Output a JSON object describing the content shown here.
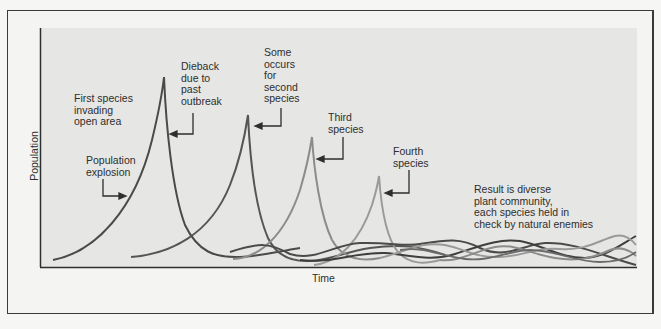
{
  "figure": {
    "ylabel": "Population",
    "xlabel": "Time",
    "annotations": [
      {
        "id": "first-species",
        "text": "First species\ninvading\nopen area"
      },
      {
        "id": "population-explosion",
        "text": "Population\nexplosion"
      },
      {
        "id": "dieback",
        "text": "Dieback\ndue to\npast\noutbreak"
      },
      {
        "id": "second-species",
        "text": "Some\noccurs\nfor\nsecond\nspecies"
      },
      {
        "id": "third-species",
        "text": "Third\nspecies"
      },
      {
        "id": "fourth-species",
        "text": "Fourth\nspecies"
      },
      {
        "id": "result",
        "text": "Result is diverse\nplant community,\neach species held in\ncheck by natural enemies"
      }
    ]
  },
  "series": [
    {
      "name": "First species",
      "color": "#4a4a4a",
      "peak_x": 164,
      "peak_y": 77
    },
    {
      "name": "Second species",
      "color": "#5a5a5a",
      "peak_x": 248,
      "peak_y": 115
    },
    {
      "name": "Third species",
      "color": "#8a8a8a",
      "peak_x": 312,
      "peak_y": 137
    },
    {
      "name": "Fourth species",
      "color": "#9a9a9a",
      "peak_x": 379,
      "peak_y": 176
    }
  ],
  "colors": {
    "plot_background": "#e6e6e4",
    "frame": "#3a3a3a",
    "dark_curve": "#4a4a4a",
    "light_curve": "#9a9a9a"
  }
}
